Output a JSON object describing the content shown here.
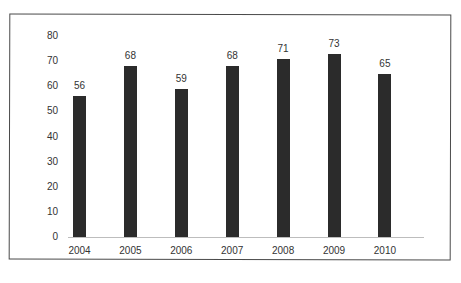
{
  "chart_data": {
    "type": "bar",
    "title": "",
    "xlabel": "",
    "ylabel": "",
    "categories": [
      "2004",
      "2005",
      "2006",
      "2007",
      "2008",
      "2009",
      "2010"
    ],
    "values": [
      56,
      68,
      59,
      68,
      71,
      73,
      65
    ],
    "data_labels": [
      "56",
      "68",
      "59",
      "68",
      "71",
      "73",
      "65"
    ],
    "ylim": [
      0,
      80
    ],
    "yticks": [
      "0",
      "10",
      "20",
      "30",
      "40",
      "50",
      "60",
      "70",
      "80"
    ],
    "grid": false,
    "legend": null,
    "bar_color": "#2b2b2b"
  }
}
